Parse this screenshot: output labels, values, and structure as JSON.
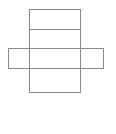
{
  "figure": {
    "kind": "geometric-net-diagram",
    "canvas": {
      "width": 116,
      "height": 134,
      "background_color": "#ffffff"
    },
    "style": {
      "stroke_color": "#8a8a8a",
      "stroke_width": 1,
      "fill_color": "none"
    },
    "shapes": [
      {
        "name": "vertical-rectangle",
        "type": "rect",
        "x": 29,
        "y": 9,
        "width": 52,
        "height": 84
      },
      {
        "name": "horizontal-band",
        "type": "rect",
        "x": 8,
        "y": 48,
        "width": 96,
        "height": 21
      }
    ],
    "fold_lines": [
      {
        "name": "top-fold-line",
        "type": "line",
        "x1": 29,
        "y1": 29,
        "x2": 81,
        "y2": 29
      }
    ]
  }
}
